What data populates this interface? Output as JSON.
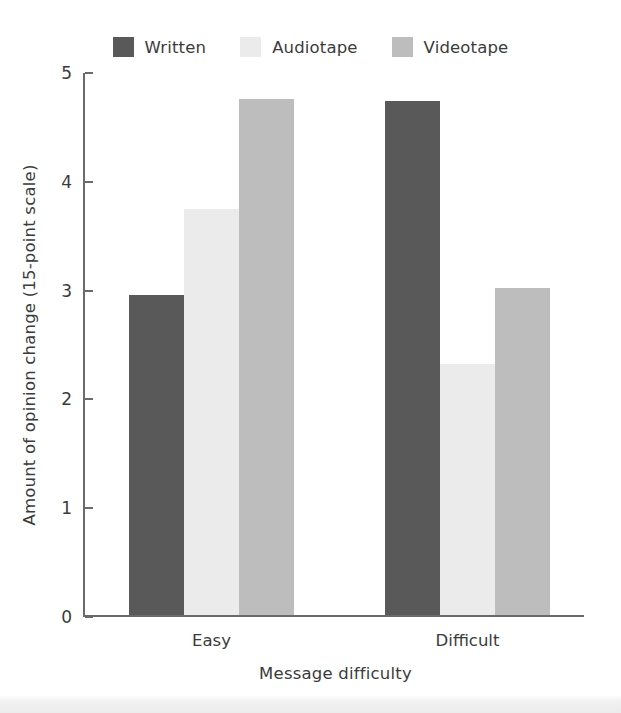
{
  "chart_data": {
    "type": "bar",
    "title": "",
    "xlabel": "Message difficulty",
    "ylabel": "Amount of opinion change (15-point scale)",
    "categories": [
      "Easy",
      "Difficult"
    ],
    "series": [
      {
        "name": "Written",
        "color": "#595959",
        "values": [
          2.94,
          4.72
        ]
      },
      {
        "name": "Audiotape",
        "color": "#ebebeb",
        "values": [
          3.73,
          2.31
        ]
      },
      {
        "name": "Videotape",
        "color": "#bdbdbd",
        "values": [
          4.74,
          3.01
        ]
      }
    ],
    "ylim": [
      0,
      5
    ],
    "ytick_labels": [
      "0",
      "1",
      "2",
      "3",
      "4",
      "5"
    ],
    "ytick_values": [
      0,
      1,
      2,
      3,
      4,
      5
    ],
    "grid": false,
    "legend_position": "top-center",
    "axis_color": "#6b6b6b",
    "text_color": "#3b3b3b",
    "background": "#ffffff"
  },
  "legend": {
    "entries": [
      {
        "label": "Written",
        "swatch_name": "legend-swatch-written"
      },
      {
        "label": "Audiotape",
        "swatch_name": "legend-swatch-audiotape"
      },
      {
        "label": "Videotape",
        "swatch_name": "legend-swatch-videotape"
      }
    ]
  },
  "axes": {
    "y_title": "Amount of opinion change (15-point scale)",
    "x_title": "Message difficulty",
    "y_ticks": [
      "5",
      "4",
      "3",
      "2",
      "1",
      "0"
    ],
    "x_ticks": [
      "Easy",
      "Difficult"
    ]
  }
}
